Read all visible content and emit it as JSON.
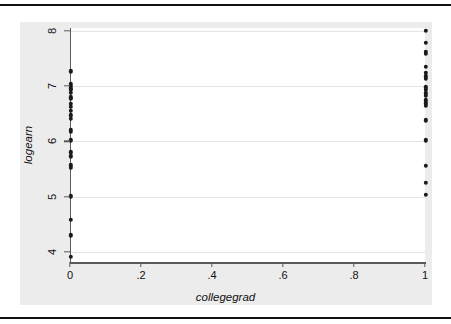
{
  "figure": {
    "background_color": "#ffffff",
    "graph_region_color": "#ececec",
    "plot_area_color": "#ffffff",
    "rule_color": "#111111",
    "axis_color": "#5a5a5a",
    "gridline_color": "#e3e3e3",
    "marker_color": "#1a1a1a"
  },
  "chart_data": {
    "type": "scatter",
    "title": "",
    "xlabel": "collegegrad",
    "ylabel": "logearn",
    "xlim": [
      0,
      1
    ],
    "ylim": [
      3.82,
      8.05
    ],
    "xticks": [
      0,
      0.2,
      0.4,
      0.6,
      0.8,
      1
    ],
    "xticklabels": [
      "0",
      ".2",
      ".4",
      ".6",
      ".8",
      "1"
    ],
    "yticks": [
      4,
      5,
      6,
      7,
      8
    ],
    "yticklabels": [
      "4",
      "5",
      "6",
      "7",
      "8"
    ],
    "grid": "horizontal",
    "legend": null,
    "marker": "filled-circle",
    "series": [
      {
        "name": "logearn vs collegegrad",
        "points": [
          {
            "x": 0,
            "y": 7.27
          },
          {
            "x": 0,
            "y": 7.04
          },
          {
            "x": 0,
            "y": 7.0
          },
          {
            "x": 0,
            "y": 6.96
          },
          {
            "x": 0,
            "y": 6.93
          },
          {
            "x": 0,
            "y": 6.88
          },
          {
            "x": 0,
            "y": 6.8
          },
          {
            "x": 0,
            "y": 6.77
          },
          {
            "x": 0,
            "y": 6.68
          },
          {
            "x": 0,
            "y": 6.62
          },
          {
            "x": 0,
            "y": 6.55
          },
          {
            "x": 0,
            "y": 6.47
          },
          {
            "x": 0,
            "y": 6.41
          },
          {
            "x": 0,
            "y": 6.21
          },
          {
            "x": 0,
            "y": 6.17
          },
          {
            "x": 0,
            "y": 6.02
          },
          {
            "x": 0,
            "y": 5.8
          },
          {
            "x": 0,
            "y": 5.73
          },
          {
            "x": 0,
            "y": 5.57
          },
          {
            "x": 0,
            "y": 5.52
          },
          {
            "x": 0,
            "y": 5.01
          },
          {
            "x": 0,
            "y": 4.58
          },
          {
            "x": 0,
            "y": 4.3
          },
          {
            "x": 0,
            "y": 3.91
          },
          {
            "x": 1,
            "y": 8.0
          },
          {
            "x": 1,
            "y": 7.78
          },
          {
            "x": 1,
            "y": 7.62
          },
          {
            "x": 1,
            "y": 7.58
          },
          {
            "x": 1,
            "y": 7.35
          },
          {
            "x": 1,
            "y": 7.24
          },
          {
            "x": 1,
            "y": 7.18
          },
          {
            "x": 1,
            "y": 7.13
          },
          {
            "x": 1,
            "y": 6.98
          },
          {
            "x": 1,
            "y": 6.93
          },
          {
            "x": 1,
            "y": 6.87
          },
          {
            "x": 1,
            "y": 6.82
          },
          {
            "x": 1,
            "y": 6.74
          },
          {
            "x": 1,
            "y": 6.69
          },
          {
            "x": 1,
            "y": 6.64
          },
          {
            "x": 1,
            "y": 6.38
          },
          {
            "x": 1,
            "y": 6.02
          },
          {
            "x": 1,
            "y": 5.56
          },
          {
            "x": 1,
            "y": 5.25
          },
          {
            "x": 1,
            "y": 5.03
          }
        ]
      }
    ]
  }
}
